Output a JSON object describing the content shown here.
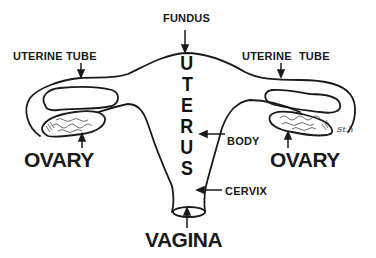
{
  "diagram": {
    "background": "#ffffff",
    "stroke_color": "#1a1a1a",
    "labels": {
      "fundus": "FUNDUS",
      "uterine_tube_left": "UTERINE TUBE",
      "uterine_tube_right": "UTERINE TUBE",
      "ovary_left": "OVARY",
      "ovary_right": "OVARY",
      "body": "BODY",
      "cervix": "CERVIX",
      "vagina": "VAGINA"
    },
    "uterus_letters": [
      "U",
      "T",
      "E",
      "R",
      "U",
      "S"
    ],
    "signature": "St.h"
  }
}
